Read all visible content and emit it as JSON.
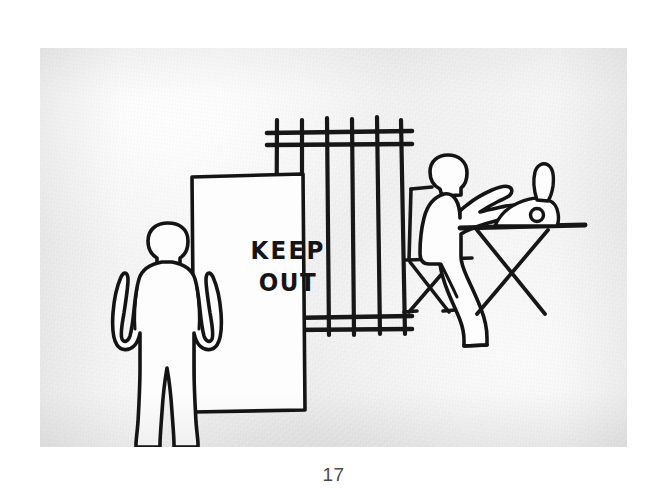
{
  "page": {
    "folio": "17",
    "background_color": "#ffffff"
  },
  "photo": {
    "name": "hand-drawn-illustration-photo",
    "paper_color": "#f2f2f2",
    "ink_color": "#1a1a1a",
    "description": "Hand-drawn ink illustration photographed on textured white paper"
  },
  "scene": {
    "sign": {
      "label_line_1": "KEEP",
      "label_line_2": "OUT",
      "fill_color": "#ffffff",
      "border_color": "#111111"
    },
    "figures": [
      {
        "name": "standing-figure",
        "pose": "standing, arms at sides, facing viewer"
      },
      {
        "name": "seated-figure",
        "pose": "seated on folding chair, arms extended toward machine on table"
      }
    ],
    "objects": [
      {
        "name": "fence",
        "detail": "row of six vertical bars with upper and lower horizontal rails"
      },
      {
        "name": "folding-chair",
        "detail": "X-frame folding chair with backrest"
      },
      {
        "name": "folding-table",
        "detail": "X-frame folding table"
      },
      {
        "name": "machine",
        "detail": "small machine with raised lever and round knob on the table"
      }
    ]
  }
}
